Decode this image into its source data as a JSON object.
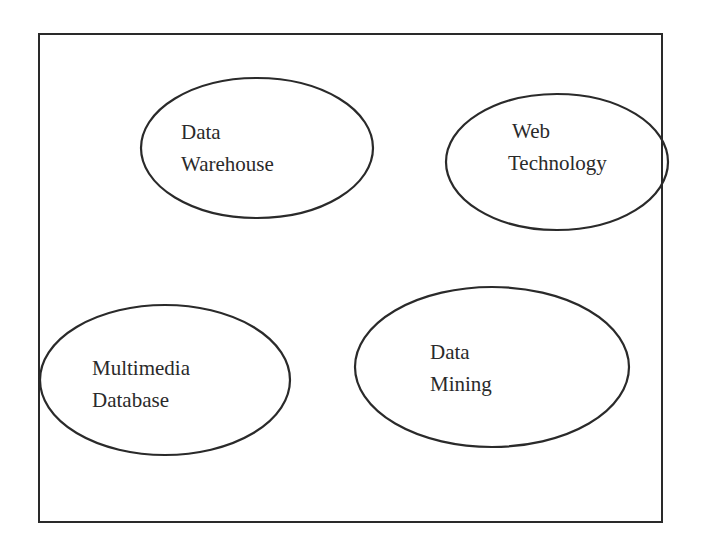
{
  "diagram": {
    "type": "venn-like grouping",
    "frame": {
      "stroke_color": "#2a2a2a",
      "background": "#ffffff"
    },
    "nodes": [
      {
        "id": "data-warehouse",
        "lines": [
          "Data",
          "Warehouse"
        ],
        "shape": "ellipse",
        "cx": 257,
        "cy": 148,
        "rx": 116,
        "ry": 70
      },
      {
        "id": "web-technology",
        "lines": [
          "Web",
          "Technology"
        ],
        "shape": "ellipse",
        "cx": 557,
        "cy": 162,
        "rx": 111,
        "ry": 68
      },
      {
        "id": "multimedia-database",
        "lines": [
          "Multimedia",
          "Database"
        ],
        "shape": "ellipse",
        "cx": 165,
        "cy": 380,
        "rx": 125,
        "ry": 75
      },
      {
        "id": "data-mining",
        "lines": [
          "Data",
          "Mining"
        ],
        "shape": "ellipse",
        "cx": 492,
        "cy": 367,
        "rx": 137,
        "ry": 80
      }
    ]
  }
}
